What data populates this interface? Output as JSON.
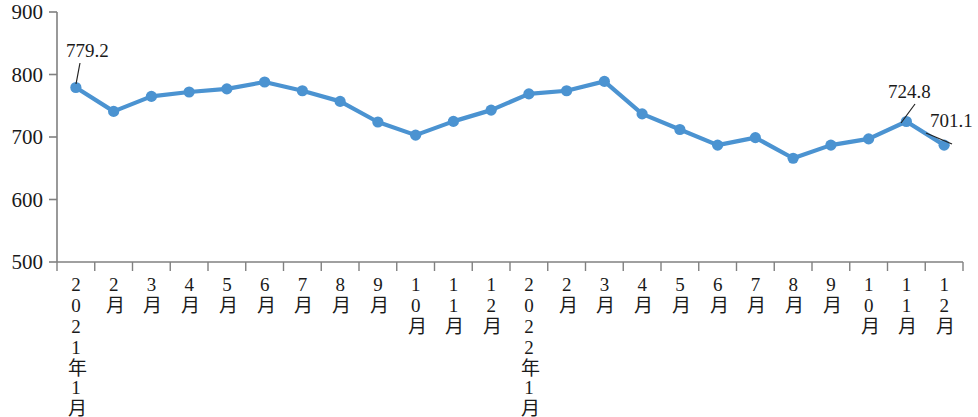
{
  "chart_data": {
    "type": "line",
    "title": "",
    "xlabel": "",
    "ylabel": "",
    "ylim": [
      500,
      900
    ],
    "ytick_step": 100,
    "yticks": [
      "500",
      "600",
      "700",
      "800",
      "900"
    ],
    "grid": false,
    "legend": false,
    "series_color": "#4B93D1",
    "categories": [
      "2021年1月",
      "2月",
      "3月",
      "4月",
      "5月",
      "6月",
      "7月",
      "8月",
      "9月",
      "10月",
      "11月",
      "12月",
      "2022年1月",
      "2月",
      "3月",
      "4月",
      "5月",
      "6月",
      "7月",
      "8月",
      "9月",
      "10月",
      "11月",
      "12月"
    ],
    "series": [
      {
        "name": "",
        "values": [
          779.2,
          741.0,
          765.0,
          772.0,
          777.0,
          788.0,
          774.0,
          757.0,
          724.0,
          703.0,
          725.0,
          743.0,
          769.0,
          774.0,
          789.0,
          737.0,
          712.0,
          687.0,
          699.0,
          666.0,
          687.0,
          697.0,
          724.8,
          687.0
        ]
      }
    ],
    "annotations": [
      {
        "id": "first-point-label",
        "text": "779.2",
        "point_index": 0
      },
      {
        "id": "nov-2022-label",
        "text": "724.8",
        "point_index": 22
      },
      {
        "id": "dec-2022-label",
        "text": "701.1",
        "point_index": 23
      }
    ]
  }
}
